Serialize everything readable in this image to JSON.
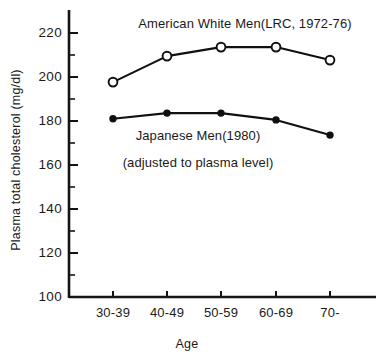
{
  "chart_data": {
    "type": "line",
    "title": "",
    "xlabel": "Age",
    "ylabel": "Plasma total cholesterol (mg/dl)",
    "categories": [
      "30-39",
      "40-49",
      "50-59",
      "60-69",
      "70-"
    ],
    "ylim": [
      100,
      228
    ],
    "ytick_labels": [
      "220",
      "200",
      "180",
      "160",
      "140",
      "120",
      "100"
    ],
    "ytick_values": [
      220,
      200,
      180,
      160,
      140,
      120,
      100
    ],
    "yminor_values": [
      230,
      210,
      190,
      170,
      150,
      130,
      110
    ],
    "grid": false,
    "legend_position": "inline-annotation",
    "series": [
      {
        "name": "American White Men(LRC, 1972-76)",
        "marker": "open-circle",
        "values": [
          197.7,
          209.5,
          213.6,
          213.6,
          207.7
        ]
      },
      {
        "name": "Japanese Men(1980)",
        "marker": "filled-circle",
        "values": [
          181.0,
          183.6,
          183.6,
          180.5,
          173.6
        ]
      }
    ],
    "annotations": [
      {
        "text": "American White Men(LRC, 1972-76)",
        "x": 245,
        "y": 28
      },
      {
        "text": "Japanese Men(1980)",
        "x": 198,
        "y": 140
      },
      {
        "text": "(adjusted to plasma level)",
        "x": 198,
        "y": 167
      }
    ]
  }
}
